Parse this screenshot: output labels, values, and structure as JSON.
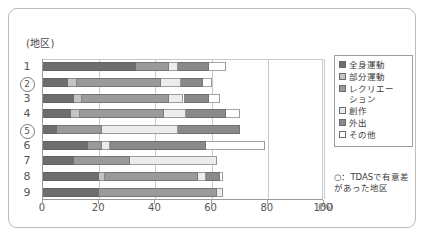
{
  "axis_title": "(地区)",
  "x_unit_label": "(%)",
  "footnote": "○：TDASで有意差があった地区",
  "legend": {
    "items": [
      {
        "label": "全身運動",
        "color": "#6e6e6e"
      },
      {
        "label": "部分運動",
        "color": "#c4c4c4"
      },
      {
        "label": "レクリエー\nション",
        "color": "#9a9a9a"
      },
      {
        "label": "創作",
        "color": "#ececec"
      },
      {
        "label": "外出",
        "color": "#8a8a8a"
      },
      {
        "label": "その他",
        "color": "#ffffff"
      }
    ]
  },
  "chart_data": {
    "type": "bar",
    "orientation": "horizontal",
    "stacked": true,
    "title": "",
    "xlabel": "(%)",
    "ylabel": "(地区)",
    "xlim": [
      0,
      100
    ],
    "xticks": [
      0,
      20,
      40,
      60,
      80,
      100
    ],
    "grid": true,
    "legend_position": "right",
    "categories": [
      "1",
      "2",
      "3",
      "4",
      "5",
      "6",
      "7",
      "8",
      "9"
    ],
    "highlighted_categories": [
      "2",
      "5"
    ],
    "highlight_note": "○：TDASで有意差があった地区",
    "series": [
      {
        "name": "全身運動",
        "values": [
          33,
          9,
          11,
          10,
          5,
          16,
          11,
          20,
          20
        ]
      },
      {
        "name": "部分運動",
        "values": [
          0,
          3,
          3,
          3,
          0,
          0,
          0,
          2,
          0
        ]
      },
      {
        "name": "レクリエーション",
        "values": [
          12,
          30,
          31,
          30,
          16,
          5,
          20,
          33,
          42
        ]
      },
      {
        "name": "創作",
        "values": [
          3,
          7,
          5,
          8,
          27,
          3,
          31,
          3,
          2
        ]
      },
      {
        "name": "外出",
        "values": [
          11,
          8,
          9,
          14,
          22,
          34,
          0,
          5,
          0
        ]
      },
      {
        "name": "その他",
        "values": [
          6,
          3,
          4,
          5,
          0,
          21,
          0,
          1,
          0
        ]
      }
    ],
    "totals": [
      65,
      60,
      63,
      70,
      70,
      79,
      62,
      64,
      64
    ]
  }
}
